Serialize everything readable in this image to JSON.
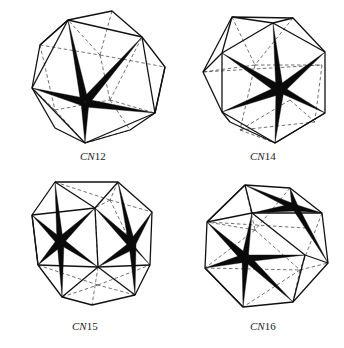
{
  "figure": {
    "panels": [
      {
        "id": "cn12",
        "label_prefix": "CN",
        "label_number": "12",
        "polyhedron": "icosahedron"
      },
      {
        "id": "cn14",
        "label_prefix": "CN",
        "label_number": "14",
        "polyhedron": "bicapped hexagonal antiprism"
      },
      {
        "id": "cn15",
        "label_prefix": "CN",
        "label_number": "15",
        "polyhedron": "Frank-Kasper CN15 polyhedron"
      },
      {
        "id": "cn16",
        "label_prefix": "CN",
        "label_number": "16",
        "polyhedron": "Frank-Kasper CN16 polyhedron"
      }
    ],
    "colors": {
      "edge": "#111111",
      "spike": "#0a0a0a",
      "background": "#ffffff"
    }
  }
}
